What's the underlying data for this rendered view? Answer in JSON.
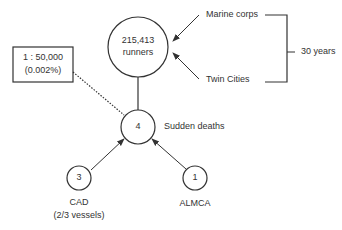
{
  "diagram": {
    "population": {
      "count": "215,413",
      "unit": "runners"
    },
    "sources": {
      "top": "Marine corps",
      "bottom": "Twin Cities"
    },
    "duration": "30 years",
    "deaths": {
      "count": "4",
      "label": "Sudden deaths"
    },
    "ratio": {
      "line1": "1 : 50,000",
      "line2": "(0.002%)"
    },
    "causes": [
      {
        "count": "3",
        "label": "CAD",
        "sublabel": "(2/3 vessels)"
      },
      {
        "count": "1",
        "label": "ALMCA"
      }
    ],
    "colors": {
      "stroke": "#333333",
      "text": "#333333",
      "background": "#ffffff"
    }
  }
}
